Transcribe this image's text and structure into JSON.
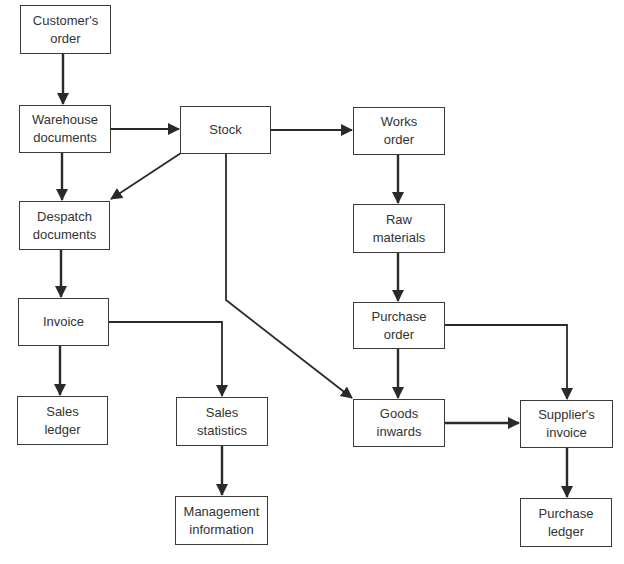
{
  "diagram": {
    "type": "flowchart",
    "line_color": "#2a2a2a",
    "nodes": {
      "customers_order": "Customer's\norder",
      "warehouse_documents": "Warehouse\ndocuments",
      "stock": "Stock",
      "works_order": "Works\norder",
      "despatch_documents": "Despatch\ndocuments",
      "raw_materials": "Raw\nmaterials",
      "invoice": "Invoice",
      "purchase_order": "Purchase\norder",
      "sales_ledger": "Sales\nledger",
      "sales_statistics": "Sales\nstatistics",
      "goods_inwards": "Goods\ninwards",
      "suppliers_invoice": "Supplier's\ninvoice",
      "management_information": "Management\ninformation",
      "purchase_ledger": "Purchase\nledger"
    },
    "edges": [
      {
        "from": "Customer's order",
        "to": "Warehouse documents"
      },
      {
        "from": "Warehouse documents",
        "to": "Stock"
      },
      {
        "from": "Warehouse documents",
        "to": "Despatch documents"
      },
      {
        "from": "Stock",
        "to": "Despatch documents"
      },
      {
        "from": "Stock",
        "to": "Works order"
      },
      {
        "from": "Stock",
        "to": "Goods inwards"
      },
      {
        "from": "Works order",
        "to": "Raw materials"
      },
      {
        "from": "Raw materials",
        "to": "Purchase order"
      },
      {
        "from": "Despatch documents",
        "to": "Invoice"
      },
      {
        "from": "Invoice",
        "to": "Sales ledger"
      },
      {
        "from": "Invoice",
        "to": "Sales statistics"
      },
      {
        "from": "Sales statistics",
        "to": "Management information"
      },
      {
        "from": "Purchase order",
        "to": "Goods inwards"
      },
      {
        "from": "Purchase order",
        "to": "Supplier's invoice"
      },
      {
        "from": "Goods inwards",
        "to": "Supplier's invoice"
      },
      {
        "from": "Supplier's invoice",
        "to": "Purchase ledger"
      }
    ]
  }
}
